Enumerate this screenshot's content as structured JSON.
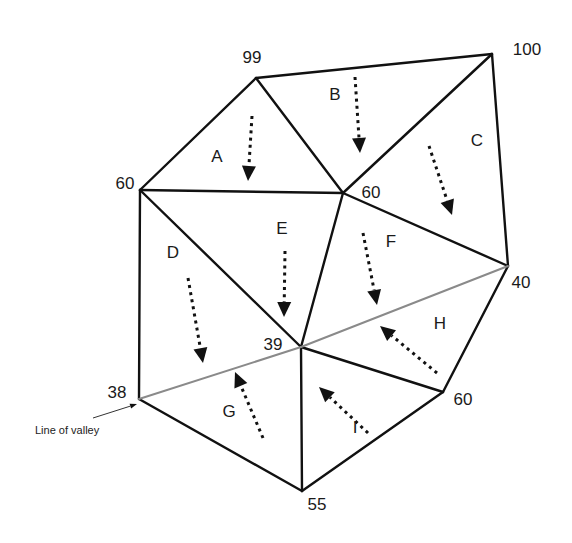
{
  "colors": {
    "edge": "#111111",
    "valley": "#8a8a8a",
    "text": "#1a1a1a"
  },
  "vertices": [
    {
      "id": "v99",
      "value": "99",
      "x": 256,
      "y": 78,
      "lx": 252,
      "ly": 63
    },
    {
      "id": "v100",
      "value": "100",
      "x": 492,
      "y": 54,
      "lx": 527,
      "ly": 55
    },
    {
      "id": "v60a",
      "value": "60",
      "x": 140,
      "y": 190,
      "lx": 125,
      "ly": 189
    },
    {
      "id": "v60b",
      "value": "60",
      "x": 343,
      "y": 193,
      "lx": 371,
      "ly": 198
    },
    {
      "id": "v40",
      "value": "40",
      "x": 508,
      "y": 266,
      "lx": 521,
      "ly": 288
    },
    {
      "id": "v39",
      "value": "39",
      "x": 301,
      "y": 347,
      "lx": 273,
      "ly": 350
    },
    {
      "id": "v60c",
      "value": "60",
      "x": 443,
      "y": 392,
      "lx": 463,
      "ly": 405
    },
    {
      "id": "v38",
      "value": "38",
      "x": 139,
      "y": 399,
      "lx": 117,
      "ly": 398
    },
    {
      "id": "v55",
      "value": "55",
      "x": 302,
      "y": 491,
      "lx": 317,
      "ly": 510
    }
  ],
  "edges": [
    {
      "from": "v99",
      "to": "v100",
      "kind": "edge"
    },
    {
      "from": "v100",
      "to": "v40",
      "kind": "edge"
    },
    {
      "from": "v99",
      "to": "v60a",
      "kind": "edge"
    },
    {
      "from": "v99",
      "to": "v60b",
      "kind": "edge"
    },
    {
      "from": "v100",
      "to": "v60b",
      "kind": "edge"
    },
    {
      "from": "v60a",
      "to": "v60b",
      "kind": "edge"
    },
    {
      "from": "v60a",
      "to": "v38",
      "kind": "edge"
    },
    {
      "from": "v60a",
      "to": "v39",
      "kind": "edge"
    },
    {
      "from": "v60b",
      "to": "v39",
      "kind": "edge"
    },
    {
      "from": "v60b",
      "to": "v40",
      "kind": "edge"
    },
    {
      "from": "v38",
      "to": "v55",
      "kind": "edge"
    },
    {
      "from": "v39",
      "to": "v55",
      "kind": "edge"
    },
    {
      "from": "v39",
      "to": "v60c",
      "kind": "edge"
    },
    {
      "from": "v60c",
      "to": "v40",
      "kind": "edge"
    },
    {
      "from": "v60c",
      "to": "v55",
      "kind": "edge"
    },
    {
      "from": "v38",
      "to": "v39",
      "kind": "valley"
    },
    {
      "from": "v39",
      "to": "v40",
      "kind": "valley"
    }
  ],
  "regions": [
    {
      "label": "A",
      "x": 217,
      "y": 162,
      "arrow": {
        "x1": 252,
        "y1": 116,
        "x2": 248,
        "y2": 181
      }
    },
    {
      "label": "B",
      "x": 335,
      "y": 100,
      "arrow": {
        "x1": 355,
        "y1": 77,
        "x2": 360,
        "y2": 153
      }
    },
    {
      "label": "C",
      "x": 477,
      "y": 146,
      "arrow": {
        "x1": 429,
        "y1": 146,
        "x2": 452,
        "y2": 215
      }
    },
    {
      "label": "D",
      "x": 173,
      "y": 258,
      "arrow": {
        "x1": 188,
        "y1": 278,
        "x2": 203,
        "y2": 363
      }
    },
    {
      "label": "E",
      "x": 282,
      "y": 234,
      "arrow": {
        "x1": 285,
        "y1": 251,
        "x2": 284,
        "y2": 317
      }
    },
    {
      "label": "F",
      "x": 391,
      "y": 247,
      "arrow": {
        "x1": 363,
        "y1": 233,
        "x2": 377,
        "y2": 305
      }
    },
    {
      "label": "G",
      "x": 229,
      "y": 417,
      "arrow": {
        "x1": 263,
        "y1": 438,
        "x2": 235,
        "y2": 372
      }
    },
    {
      "label": "H",
      "x": 440,
      "y": 329,
      "arrow": {
        "x1": 437,
        "y1": 373,
        "x2": 380,
        "y2": 326
      }
    },
    {
      "label": "I",
      "x": 355,
      "y": 433,
      "arrow": {
        "x1": 368,
        "y1": 433,
        "x2": 319,
        "y2": 387
      }
    }
  ],
  "annotation": {
    "text": "Line of valley",
    "x": 35,
    "y": 434,
    "arrow": {
      "x1": 93,
      "y1": 418,
      "x2": 137,
      "y2": 404
    }
  }
}
